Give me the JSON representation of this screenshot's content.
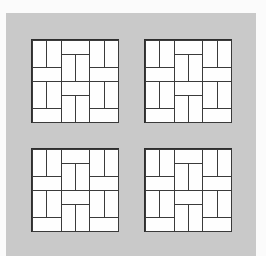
{
  "figure": {
    "background_color": "#c9c9c9",
    "tile_color": "#fdfdfd",
    "line_color": "#2e2e2e",
    "grid_units": 6,
    "tiles": [
      {
        "name": "tile-top-left",
        "x": 32,
        "y": 40
      },
      {
        "name": "tile-top-right",
        "x": 145,
        "y": 40
      },
      {
        "name": "tile-bottom-left",
        "x": 32,
        "y": 149
      },
      {
        "name": "tile-bottom-right",
        "x": 145,
        "y": 149
      }
    ],
    "bricks": [
      {
        "orientation": "vertical",
        "col": 0,
        "row": 0,
        "w": 1,
        "h": 2
      },
      {
        "orientation": "vertical",
        "col": 1,
        "row": 0,
        "w": 1,
        "h": 2
      },
      {
        "orientation": "horizontal",
        "col": 0,
        "row": 2,
        "w": 2,
        "h": 1
      },
      {
        "orientation": "horizontal",
        "col": 2,
        "row": 0,
        "w": 2,
        "h": 1
      },
      {
        "orientation": "vertical",
        "col": 2,
        "row": 1,
        "w": 1,
        "h": 2
      },
      {
        "orientation": "vertical",
        "col": 3,
        "row": 1,
        "w": 1,
        "h": 2
      },
      {
        "orientation": "vertical",
        "col": 4,
        "row": 0,
        "w": 1,
        "h": 2
      },
      {
        "orientation": "vertical",
        "col": 5,
        "row": 0,
        "w": 1,
        "h": 2
      },
      {
        "orientation": "horizontal",
        "col": 4,
        "row": 2,
        "w": 2,
        "h": 1
      },
      {
        "orientation": "vertical",
        "col": 0,
        "row": 3,
        "w": 1,
        "h": 2
      },
      {
        "orientation": "vertical",
        "col": 1,
        "row": 3,
        "w": 1,
        "h": 2
      },
      {
        "orientation": "horizontal",
        "col": 0,
        "row": 5,
        "w": 2,
        "h": 1
      },
      {
        "orientation": "horizontal",
        "col": 2,
        "row": 3,
        "w": 2,
        "h": 1
      },
      {
        "orientation": "vertical",
        "col": 2,
        "row": 4,
        "w": 1,
        "h": 2
      },
      {
        "orientation": "vertical",
        "col": 3,
        "row": 4,
        "w": 1,
        "h": 2
      },
      {
        "orientation": "vertical",
        "col": 4,
        "row": 3,
        "w": 1,
        "h": 2
      },
      {
        "orientation": "vertical",
        "col": 5,
        "row": 3,
        "w": 1,
        "h": 2
      },
      {
        "orientation": "horizontal",
        "col": 4,
        "row": 5,
        "w": 2,
        "h": 1
      }
    ]
  }
}
